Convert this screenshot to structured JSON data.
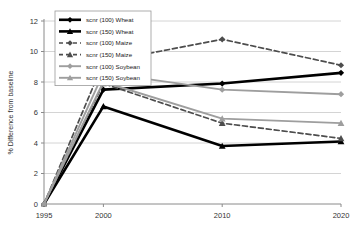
{
  "chart_data": {
    "type": "line",
    "title": "",
    "xlabel": "",
    "ylabel": "% Difference from baseline",
    "categories": [
      "1995",
      "2000",
      "2010",
      "2020"
    ],
    "x": [
      1995,
      2000,
      2010,
      2020
    ],
    "xlim": [
      1995,
      2020
    ],
    "ylim": [
      0,
      12
    ],
    "yticks": [
      0,
      2,
      4,
      6,
      8,
      10,
      12
    ],
    "ytick_labels": [
      "0",
      "2",
      "4",
      "6",
      "8",
      "10",
      "12"
    ],
    "xtick_labels": [
      "1995",
      "2000",
      "2010",
      "2020"
    ],
    "grid": "horizontal",
    "legend_position": "top-left",
    "series": [
      {
        "name": "scnr (100) Wheat",
        "values": [
          0,
          7.5,
          7.9,
          8.6
        ],
        "color": "#000000",
        "style": "solid",
        "marker": "diamond",
        "width": 2.6
      },
      {
        "name": "scnr (150) Wheat",
        "values": [
          0,
          6.4,
          3.8,
          4.1
        ],
        "color": "#000000",
        "style": "solid",
        "marker": "triangle",
        "width": 2.6
      },
      {
        "name": "scnr (100) Maize",
        "values": [
          0,
          9.3,
          10.8,
          9.1
        ],
        "color": "#4d4d4d",
        "style": "dashed",
        "marker": "diamond",
        "width": 1.7
      },
      {
        "name": "scnr (150) Maize",
        "values": [
          0,
          7.9,
          5.3,
          4.3
        ],
        "color": "#4d4d4d",
        "style": "dashed",
        "marker": "triangle",
        "width": 1.7
      },
      {
        "name": "scnr (100) Soybean",
        "values": [
          0,
          8.6,
          7.5,
          7.2
        ],
        "color": "#9e9e9e",
        "style": "solid",
        "marker": "diamond",
        "width": 1.9
      },
      {
        "name": "scnr (150) Soybean",
        "values": [
          0,
          8.0,
          5.6,
          5.3
        ],
        "color": "#9e9e9e",
        "style": "solid",
        "marker": "triangle",
        "width": 1.9
      }
    ]
  },
  "legend": {
    "items": [
      {
        "label": "scnr (100) Wheat"
      },
      {
        "label": "scnr (150) Wheat"
      },
      {
        "label": "scnr (100) Maize"
      },
      {
        "label": "scnr (150) Maize"
      },
      {
        "label": "scnr (100) Soybean"
      },
      {
        "label": "scnr (150) Soybean"
      }
    ]
  }
}
